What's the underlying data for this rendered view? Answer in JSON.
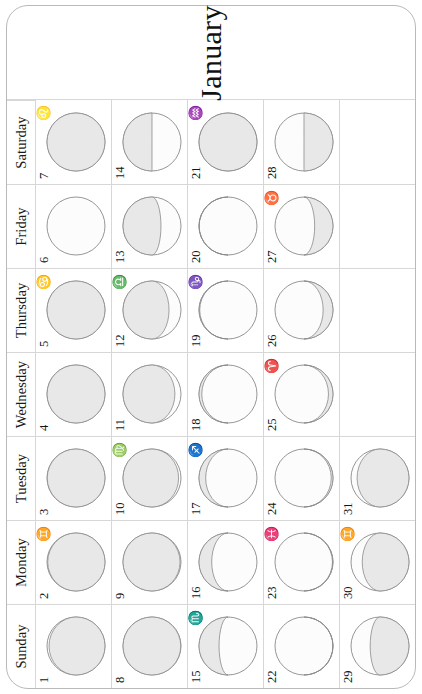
{
  "month": {
    "title": "January",
    "name": "January"
  },
  "weekdays": [
    "Sunday",
    "Monday",
    "Tuesday",
    "Wednesday",
    "Thursday",
    "Friday",
    "Saturday"
  ],
  "colors": {
    "page_background": "#ffffff",
    "grid_line": "#d7d7d7",
    "frame_line": "#b9b9b9",
    "text": "#141414",
    "moon_outline": "#8a8a8a",
    "moon_lit": "#e8e8e8",
    "moon_dark": "#fcfcfc"
  },
  "legend": {
    "lit_label": "illuminated",
    "dark_label": "shadow"
  },
  "days": [
    {
      "num": "1",
      "weekday": "Sunday",
      "week": 1,
      "zodiac": "",
      "zodiac_name": "",
      "illum": 0.12,
      "waxing": false,
      "phase": "waning-crescent"
    },
    {
      "num": "2",
      "weekday": "Monday",
      "week": 1,
      "zodiac": "♊",
      "zodiac_name": "gemini",
      "illum": 0.07,
      "waxing": false,
      "phase": "waning-crescent"
    },
    {
      "num": "3",
      "weekday": "Tuesday",
      "week": 1,
      "zodiac": "",
      "zodiac_name": "",
      "illum": 0.04,
      "waxing": false,
      "phase": "waning-crescent"
    },
    {
      "num": "4",
      "weekday": "Wednesday",
      "week": 1,
      "zodiac": "",
      "zodiac_name": "",
      "illum": 0.02,
      "waxing": false,
      "phase": "new-moon"
    },
    {
      "num": "5",
      "weekday": "Thursday",
      "week": 1,
      "zodiac": "♋",
      "zodiac_name": "cancer",
      "illum": 0.01,
      "waxing": false,
      "phase": "new-moon"
    },
    {
      "num": "6",
      "weekday": "Friday",
      "week": 1,
      "zodiac": "",
      "zodiac_name": "",
      "illum": 0.0,
      "waxing": true,
      "phase": "new-moon"
    },
    {
      "num": "7",
      "weekday": "Saturday",
      "week": 1,
      "zodiac": "♌",
      "zodiac_name": "leo",
      "illum": 0.01,
      "waxing": true,
      "phase": "new-moon"
    },
    {
      "num": "8",
      "weekday": "Sunday",
      "week": 2,
      "zodiac": "",
      "zodiac_name": "",
      "illum": 0.04,
      "waxing": true,
      "phase": "waxing-crescent"
    },
    {
      "num": "9",
      "weekday": "Monday",
      "week": 2,
      "zodiac": "",
      "zodiac_name": "",
      "illum": 0.08,
      "waxing": true,
      "phase": "waxing-crescent"
    },
    {
      "num": "10",
      "weekday": "Tuesday",
      "week": 2,
      "zodiac": "♍",
      "zodiac_name": "virgo",
      "illum": 0.13,
      "waxing": true,
      "phase": "waxing-crescent"
    },
    {
      "num": "11",
      "weekday": "Wednesday",
      "week": 2,
      "zodiac": "",
      "zodiac_name": "",
      "illum": 0.21,
      "waxing": true,
      "phase": "waxing-crescent"
    },
    {
      "num": "12",
      "weekday": "Thursday",
      "week": 2,
      "zodiac": "♎",
      "zodiac_name": "libra",
      "illum": 0.3,
      "waxing": true,
      "phase": "waxing-crescent"
    },
    {
      "num": "13",
      "weekday": "Friday",
      "week": 2,
      "zodiac": "",
      "zodiac_name": "",
      "illum": 0.4,
      "waxing": true,
      "phase": "waxing-crescent"
    },
    {
      "num": "14",
      "weekday": "Saturday",
      "week": 2,
      "zodiac": "",
      "zodiac_name": "",
      "illum": 0.5,
      "waxing": true,
      "phase": "first-quarter"
    },
    {
      "num": "15",
      "weekday": "Sunday",
      "week": 3,
      "zodiac": "♏",
      "zodiac_name": "scorpio",
      "illum": 0.6,
      "waxing": true,
      "phase": "waxing-gibbous"
    },
    {
      "num": "16",
      "weekday": "Monday",
      "week": 3,
      "zodiac": "",
      "zodiac_name": "",
      "illum": 0.69,
      "waxing": true,
      "phase": "waxing-gibbous"
    },
    {
      "num": "17",
      "weekday": "Tuesday",
      "week": 3,
      "zodiac": "♐",
      "zodiac_name": "sagittarius",
      "illum": 0.78,
      "waxing": true,
      "phase": "waxing-gibbous"
    },
    {
      "num": "18",
      "weekday": "Wednesday",
      "week": 3,
      "zodiac": "",
      "zodiac_name": "",
      "illum": 0.86,
      "waxing": true,
      "phase": "waxing-gibbous"
    },
    {
      "num": "19",
      "weekday": "Thursday",
      "week": 3,
      "zodiac": "♑",
      "zodiac_name": "capricorn",
      "illum": 0.93,
      "waxing": true,
      "phase": "waxing-gibbous"
    },
    {
      "num": "20",
      "weekday": "Friday",
      "week": 3,
      "zodiac": "",
      "zodiac_name": "",
      "illum": 0.97,
      "waxing": true,
      "phase": "waxing-gibbous"
    },
    {
      "num": "21",
      "weekday": "Saturday",
      "week": 3,
      "zodiac": "♒",
      "zodiac_name": "aquarius",
      "illum": 1.0,
      "waxing": true,
      "phase": "full-moon"
    },
    {
      "num": "22",
      "weekday": "Sunday",
      "week": 4,
      "zodiac": "",
      "zodiac_name": "",
      "illum": 0.98,
      "waxing": false,
      "phase": "waning-gibbous"
    },
    {
      "num": "23",
      "weekday": "Monday",
      "week": 4,
      "zodiac": "♓",
      "zodiac_name": "pisces",
      "illum": 0.94,
      "waxing": false,
      "phase": "waning-gibbous"
    },
    {
      "num": "24",
      "weekday": "Tuesday",
      "week": 4,
      "zodiac": "",
      "zodiac_name": "",
      "illum": 0.89,
      "waxing": false,
      "phase": "waning-gibbous"
    },
    {
      "num": "25",
      "weekday": "Wednesday",
      "week": 4,
      "zodiac": "♈",
      "zodiac_name": "aries",
      "illum": 0.82,
      "waxing": false,
      "phase": "waning-gibbous"
    },
    {
      "num": "26",
      "weekday": "Thursday",
      "week": 4,
      "zodiac": "",
      "zodiac_name": "",
      "illum": 0.73,
      "waxing": false,
      "phase": "waning-gibbous"
    },
    {
      "num": "27",
      "weekday": "Friday",
      "week": 4,
      "zodiac": "♉",
      "zodiac_name": "taurus",
      "illum": 0.62,
      "waxing": false,
      "phase": "waning-gibbous"
    },
    {
      "num": "28",
      "weekday": "Saturday",
      "week": 4,
      "zodiac": "",
      "zodiac_name": "",
      "illum": 0.5,
      "waxing": false,
      "phase": "last-quarter"
    },
    {
      "num": "29",
      "weekday": "Sunday",
      "week": 5,
      "zodiac": "",
      "zodiac_name": "",
      "illum": 0.39,
      "waxing": false,
      "phase": "waning-crescent"
    },
    {
      "num": "30",
      "weekday": "Monday",
      "week": 5,
      "zodiac": "♊",
      "zodiac_name": "gemini",
      "illum": 0.29,
      "waxing": false,
      "phase": "waning-crescent"
    },
    {
      "num": "31",
      "weekday": "Tuesday",
      "week": 5,
      "zodiac": "",
      "zodiac_name": "",
      "illum": 0.21,
      "waxing": false,
      "phase": "waning-crescent"
    },
    {
      "num": "",
      "weekday": "Wednesday",
      "week": 5,
      "zodiac": "",
      "zodiac_name": "",
      "illum": null,
      "waxing": null,
      "phase": ""
    },
    {
      "num": "",
      "weekday": "Thursday",
      "week": 5,
      "zodiac": "",
      "zodiac_name": "",
      "illum": null,
      "waxing": null,
      "phase": ""
    },
    {
      "num": "",
      "weekday": "Friday",
      "week": 5,
      "zodiac": "",
      "zodiac_name": "",
      "illum": null,
      "waxing": null,
      "phase": ""
    },
    {
      "num": "",
      "weekday": "Saturday",
      "week": 5,
      "zodiac": "",
      "zodiac_name": "",
      "illum": null,
      "waxing": null,
      "phase": ""
    }
  ]
}
